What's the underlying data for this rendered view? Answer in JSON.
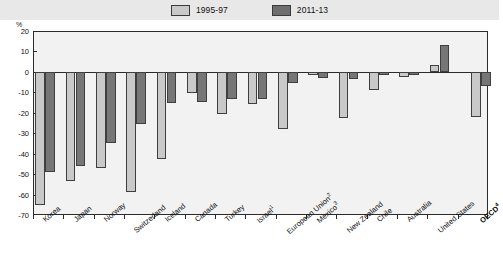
{
  "legend": {
    "items": [
      {
        "label": "1995-97",
        "color": "#c9c9c9",
        "name": "legend-1995-97"
      },
      {
        "label": "2011-13",
        "color": "#6e6e6e",
        "name": "legend-2011-13"
      }
    ]
  },
  "axis": {
    "unit_label": "%",
    "y_ticks": [
      "20",
      "10",
      "0",
      "-10",
      "-20",
      "-30",
      "-40",
      "-50",
      "-60",
      "-70"
    ]
  },
  "chart_data": {
    "type": "bar",
    "title": "",
    "xlabel": "",
    "ylabel": "%",
    "ylim": [
      -70,
      20
    ],
    "ytick_values": [
      20,
      10,
      0,
      -10,
      -20,
      -30,
      -40,
      -50,
      -60,
      -70
    ],
    "grid": false,
    "legend_position": "top-center",
    "categories": [
      "Korea",
      "Japan",
      "Norway",
      "Switzerland",
      "Iceland",
      "Canada",
      "Turkey",
      "Israel¹",
      "European Union²",
      "Mexico³",
      "New Zealand",
      "Chile",
      "Australia",
      "United States",
      "OECD⁴"
    ],
    "series": [
      {
        "name": "1995-97",
        "color": "#c9c9c9",
        "values": [
          -65,
          -53.5,
          -47,
          -59,
          -42.5,
          -10.5,
          -20.5,
          -15.5,
          -28,
          -1.5,
          -22.5,
          -9,
          -2.5,
          3.5,
          -22
        ]
      },
      {
        "name": "2011-13",
        "color": "#6e6e6e",
        "values": [
          -49,
          -46,
          -35,
          -25.5,
          -15,
          -14.5,
          -13.5,
          -13.5,
          -5.5,
          -3,
          -3.5,
          -1.5,
          -1.5,
          13,
          -7
        ]
      }
    ]
  }
}
